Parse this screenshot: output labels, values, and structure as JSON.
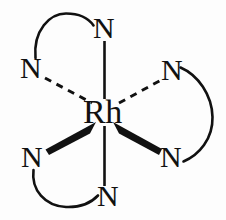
{
  "diagram": {
    "type": "chemical-structure",
    "colors": {
      "background": "#fdfdfd",
      "stroke": "#111111",
      "text": "#111111"
    },
    "center_atom": {
      "symbol": "Rh",
      "x": 104,
      "y": 113
    },
    "ligand_atoms": [
      {
        "id": "n-top",
        "symbol": "N",
        "x": 104,
        "y": 28,
        "position": "top"
      },
      {
        "id": "n-upper-left",
        "symbol": "N",
        "x": 31,
        "y": 68,
        "position": "upper-left"
      },
      {
        "id": "n-upper-right",
        "symbol": "N",
        "x": 172,
        "y": 70,
        "position": "upper-right"
      },
      {
        "id": "n-lower-left",
        "symbol": "N",
        "x": 32,
        "y": 157,
        "position": "lower-left"
      },
      {
        "id": "n-lower-right",
        "symbol": "N",
        "x": 171,
        "y": 157,
        "position": "lower-right"
      },
      {
        "id": "n-bottom",
        "symbol": "N",
        "x": 108,
        "y": 196,
        "position": "bottom"
      }
    ],
    "bonds": [
      {
        "id": "bond-top",
        "style": "plain",
        "from": "Rh",
        "to": "n-top"
      },
      {
        "id": "bond-bottom",
        "style": "plain",
        "from": "Rh",
        "to": "n-bottom"
      },
      {
        "id": "bond-upper-left",
        "style": "dashed",
        "from": "Rh",
        "to": "n-upper-left"
      },
      {
        "id": "bond-upper-right",
        "style": "dashed",
        "from": "Rh",
        "to": "n-upper-right"
      },
      {
        "id": "bond-lower-left",
        "style": "wedge",
        "from": "Rh",
        "to": "n-lower-left"
      },
      {
        "id": "bond-lower-right",
        "style": "wedge",
        "from": "Rh",
        "to": "n-lower-right"
      }
    ],
    "chelate_arcs": [
      {
        "id": "arc-top-left",
        "links": [
          "n-upper-left",
          "n-top"
        ]
      },
      {
        "id": "arc-right",
        "links": [
          "n-upper-right",
          "n-lower-right"
        ]
      },
      {
        "id": "arc-bottom-left",
        "links": [
          "n-lower-left",
          "n-bottom"
        ]
      }
    ]
  }
}
